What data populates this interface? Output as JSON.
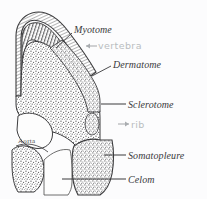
{
  "figure": {
    "background_color": "#fcfcfd",
    "ink_color": "#39393b",
    "pencil_color": "#b9bcc0",
    "labels": [
      {
        "id": "myotome",
        "text": "Myotome",
        "style": "ink",
        "x": 74,
        "y": 25,
        "leader": "line-down-left"
      },
      {
        "id": "vertebra",
        "text": "vertebra",
        "style": "pencil",
        "x": 98,
        "y": 41,
        "leader": "arrow-left"
      },
      {
        "id": "dermatome",
        "text": "Dermatome",
        "style": "ink",
        "x": 113,
        "y": 60,
        "leader": "line-down-left"
      },
      {
        "id": "sclerotome",
        "text": "Sclerotome",
        "style": "ink",
        "x": 128,
        "y": 100,
        "leader": "line-left"
      },
      {
        "id": "rib",
        "text": "rib",
        "style": "pencil",
        "x": 131,
        "y": 120,
        "leader": "arrow-right"
      },
      {
        "id": "somatopleure",
        "text": "Somatopleure",
        "style": "ink",
        "x": 128,
        "y": 151,
        "leader": "line-left"
      },
      {
        "id": "celom",
        "text": "Celom",
        "style": "ink",
        "x": 128,
        "y": 175,
        "leader": "line-left"
      },
      {
        "id": "aorta",
        "text": "Aorta",
        "style": "small",
        "x": 18,
        "y": 138,
        "leader": "none"
      }
    ]
  }
}
